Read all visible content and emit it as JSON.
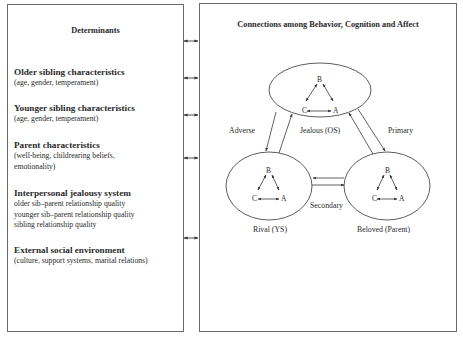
{
  "left_panel": {
    "title": "Determinants",
    "items": [
      {
        "heading": "Older sibling characteristics",
        "details": [
          "(age, gender, temperament)"
        ]
      },
      {
        "heading": "Younger sibling characteristics",
        "details": [
          "(age, gender, temperament)"
        ]
      },
      {
        "heading": "Parent characteristics",
        "details": [
          "(well-being, childrearing beliefs,",
          "emotionality)"
        ]
      },
      {
        "heading": "Interpersonal jealousy system",
        "details": [
          "older sib–parent relationship quality",
          "younger sib–parent relationship quality",
          "sibling relationship quality"
        ]
      },
      {
        "heading": "External social environment",
        "details": [
          "(culture, support systems, marital relations)"
        ]
      }
    ]
  },
  "right_panel": {
    "title": "Connections among Behavior, Cognition and Affect",
    "nodes": [
      {
        "id": "jealous",
        "label": "Jealous (OS)",
        "letters": {
          "b": "B",
          "c": "C",
          "a": "A"
        }
      },
      {
        "id": "rival",
        "label": "Rival (YS)",
        "letters": {
          "b": "B",
          "c": "C",
          "a": "A"
        }
      },
      {
        "id": "beloved",
        "label": "Beloved (Parent)",
        "letters": {
          "b": "B",
          "c": "C",
          "a": "A"
        }
      }
    ],
    "edges": [
      {
        "from": "jealous",
        "to": "rival",
        "label": "Adverse",
        "bidirectional": true
      },
      {
        "from": "jealous",
        "to": "beloved",
        "label": "Primary",
        "bidirectional": true
      },
      {
        "from": "rival",
        "to": "beloved",
        "label": "Secondary",
        "bidirectional": true
      }
    ]
  },
  "connectors": {
    "count": 6,
    "style": "double-headed-arrow"
  },
  "colors": {
    "line": "#4a4a4a",
    "text": "#2a2a2a",
    "background": "#ffffff"
  }
}
